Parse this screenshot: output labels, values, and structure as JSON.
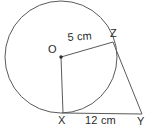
{
  "figure": {
    "background_color": "#ffffff",
    "stroke_color": "#5a5a5a",
    "text_color": "#2b2b2b",
    "points": {
      "center_label": "O",
      "tangent_point_label": "Z",
      "bottom_tangent_point_label": "X",
      "external_point_label": "Y"
    },
    "measurements": {
      "radius": "5 cm",
      "tangent_segment": "12 cm"
    },
    "geometry": {
      "circle": {
        "cx": 61,
        "cy": 57,
        "r": 56
      },
      "center_dot": {
        "cx": 61,
        "cy": 57,
        "r": 1.6
      },
      "radius_to_z": {
        "x1": 61,
        "y1": 57,
        "x2": 113,
        "y2": 42
      },
      "radius_to_x": {
        "x1": 61,
        "y1": 57,
        "x2": 63,
        "y2": 113
      },
      "tangent_zy": {
        "x1": 113,
        "y1": 42,
        "x2": 142,
        "y2": 114
      },
      "tangent_xy": {
        "x1": 62,
        "y1": 113,
        "x2": 142,
        "y2": 114
      }
    }
  }
}
